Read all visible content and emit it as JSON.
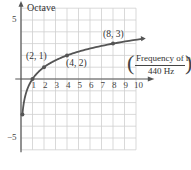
{
  "chart_data": {
    "type": "line",
    "title": "",
    "xlabel_numerator": "Frequency of note",
    "xlabel_denominator": "440 Hz",
    "ylabel": "Octave",
    "function": "y = log2(x)",
    "x_ticks": [
      "1",
      "2",
      "3",
      "4",
      "5",
      "6",
      "7",
      "8",
      "9",
      "10"
    ],
    "y_ticks": [
      "5",
      "-5"
    ],
    "xlim": [
      0,
      11
    ],
    "ylim": [
      -6,
      6
    ],
    "grid": true,
    "series": [
      {
        "name": "octave curve",
        "x": [
          0.125,
          0.25,
          0.5,
          1,
          2,
          4,
          8,
          10.5
        ],
        "y": [
          -3,
          -2,
          -1,
          0,
          1,
          2,
          3,
          3.39
        ]
      }
    ],
    "annotations": [
      {
        "label": "(2, 1)",
        "x": 2,
        "y": 1
      },
      {
        "label": "(4, 2)",
        "x": 4,
        "y": 2
      },
      {
        "label": "(8, 3)",
        "x": 8,
        "y": 3
      }
    ],
    "colors": {
      "curve": "#555555",
      "grid": "#cfcfcf",
      "axis": "#555555"
    }
  }
}
